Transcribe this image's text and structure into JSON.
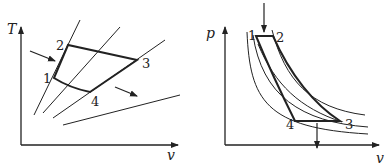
{
  "left_diagram": {
    "y_axis_label": "T",
    "x_axis_label": "v",
    "points": [
      {
        "label": "1",
        "x": 54,
        "y": 78
      },
      {
        "label": "2",
        "x": 68,
        "y": 45
      },
      {
        "label": "3",
        "x": 137,
        "y": 60
      },
      {
        "label": "4",
        "x": 90,
        "y": 92
      }
    ]
  },
  "right_diagram": {
    "y_axis_label": "p",
    "x_axis_label": "v",
    "points": [
      {
        "label": "1",
        "x": 256,
        "y": 36
      },
      {
        "label": "2",
        "x": 273,
        "y": 36
      },
      {
        "label": "3",
        "x": 340,
        "y": 121
      },
      {
        "label": "4",
        "x": 295,
        "y": 121
      }
    ]
  },
  "colors": {
    "line": "#222222",
    "background": "#ffffff"
  }
}
